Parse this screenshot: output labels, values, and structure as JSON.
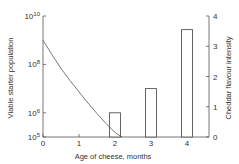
{
  "chart_data": {
    "type": "bar+line",
    "title": "",
    "xlabel": "Age of cheese,  months",
    "ylabel_left": "Viable starter population",
    "ylabel_right": "Cheddar flavour intensity",
    "x_ticks": [
      "0",
      "1",
      "2",
      "3",
      "4"
    ],
    "xlim": [
      0,
      4.3
    ],
    "y_left_scale": "log",
    "y_left_ticks": [
      {
        "exp": 10,
        "label": "10",
        "sup": "10"
      },
      {
        "exp": 8,
        "label": "10",
        "sup": "8"
      },
      {
        "exp": 6,
        "label": "10",
        "sup": "6"
      },
      {
        "exp": 5,
        "label": "10",
        "sup": "5"
      }
    ],
    "y_left_lim": [
      100000,
      10000000000
    ],
    "y_right_ticks": [
      "0",
      "1",
      "2",
      "3",
      "4"
    ],
    "y_right_lim": [
      0,
      4
    ],
    "series": [
      {
        "name": "Viable starter population",
        "kind": "line",
        "axis": "left",
        "x": [
          0,
          0.5,
          1,
          1.5,
          2,
          2.2
        ],
        "y_log10": [
          9.0,
          7.8,
          6.86,
          5.95,
          5.17,
          5.0
        ]
      },
      {
        "name": "Cheddar flavour intensity",
        "kind": "bar",
        "axis": "right",
        "categories": [
          "2",
          "3",
          "4"
        ],
        "values": [
          0.8,
          1.6,
          3.55
        ]
      }
    ],
    "grid": false,
    "legend": "none"
  }
}
